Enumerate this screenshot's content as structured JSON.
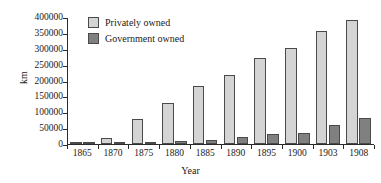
{
  "chart_data": {
    "type": "bar",
    "title": "",
    "xlabel": "Year",
    "ylabel": "km",
    "categories": [
      "1865",
      "1870",
      "1875",
      "1880",
      "1885",
      "1890",
      "1895",
      "1900",
      "1903",
      "1908"
    ],
    "series": [
      {
        "name": "Privately owned",
        "color": "#d4d4d4",
        "values": [
          2000,
          20000,
          80000,
          130000,
          182000,
          218000,
          270000,
          303000,
          355000,
          390000
        ]
      },
      {
        "name": "Government owned",
        "color": "#808080",
        "values": [
          1000,
          4000,
          7000,
          10000,
          14000,
          22000,
          30000,
          35000,
          60000,
          82000
        ]
      }
    ],
    "ylim": [
      0,
      400000
    ],
    "yticks": [
      0,
      50000,
      100000,
      150000,
      200000,
      250000,
      300000,
      350000,
      400000
    ],
    "ytick_labels": [
      "0",
      "50000",
      "100000",
      "150000",
      "200000",
      "250000",
      "300000",
      "350000",
      "400000"
    ],
    "grid": false,
    "legend_position": "top-left"
  },
  "legend": {
    "items": [
      {
        "label": "Privately owned",
        "swatch_name": "legend-swatch-privately-owned"
      },
      {
        "label": "Government owned",
        "swatch_name": "legend-swatch-government-owned"
      }
    ]
  },
  "axes": {
    "y_title": "km",
    "x_title": "Year"
  }
}
